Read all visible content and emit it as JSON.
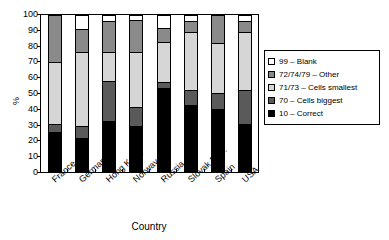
{
  "chart_data": {
    "type": "bar",
    "subtype": "stacked-percentage",
    "title": "",
    "xlabel": "Country",
    "ylabel": "%",
    "ylim": [
      0,
      100
    ],
    "yticks": [
      0,
      10,
      20,
      30,
      40,
      50,
      60,
      70,
      80,
      90,
      100
    ],
    "grid": false,
    "legend_position": "right",
    "categories": [
      "France",
      "Germany",
      "Hong Kong",
      "Norway",
      "Russia",
      "Slovak Rep.",
      "Spain",
      "USA"
    ],
    "series": [
      {
        "name": "10 – Correct",
        "key": "correct",
        "color": "#000000",
        "values": [
          25,
          21,
          32,
          29,
          53,
          42,
          40,
          30
        ]
      },
      {
        "name": "70 – Cells biggest",
        "key": "biggest",
        "color": "#5a5a5a",
        "values": [
          5,
          8,
          26,
          12,
          4,
          10,
          10,
          22
        ]
      },
      {
        "name": "71/73 – Cells smallest",
        "key": "smallest",
        "color": "#d6d6d6",
        "values": [
          40,
          47,
          18,
          35,
          26,
          37,
          32,
          37
        ]
      },
      {
        "name": "72/74/79 – Other",
        "key": "other",
        "color": "#8a8a8a",
        "values": [
          30,
          15,
          20,
          21,
          9,
          7,
          18,
          7
        ]
      },
      {
        "name": "99 – Blank",
        "key": "blank",
        "color": "#ffffff",
        "values": [
          0,
          9,
          4,
          3,
          8,
          4,
          0,
          4
        ]
      }
    ]
  },
  "legend": {
    "items": [
      {
        "label": "99 – Blank",
        "swatch": "legend-swatch-blank"
      },
      {
        "label": "72/74/79 – Other",
        "swatch": "legend-swatch-other"
      },
      {
        "label": "71/73 – Cells smallest",
        "swatch": "legend-swatch-smallest"
      },
      {
        "label": "70 – Cells biggest",
        "swatch": "legend-swatch-biggest"
      },
      {
        "label": "10 – Correct",
        "swatch": "legend-swatch-correct"
      }
    ]
  },
  "axes": {
    "y_title": "%",
    "x_title": "Country"
  }
}
